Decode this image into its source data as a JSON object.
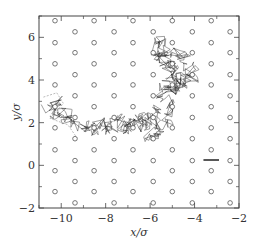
{
  "chart_data": {
    "type": "scatter",
    "title": "",
    "xlabel": "x/σ",
    "ylabel": "y/σ",
    "xlim": [
      -11,
      -2
    ],
    "ylim": [
      -2,
      7
    ],
    "xticks": [
      -10,
      -8,
      -6,
      -4,
      -2
    ],
    "yticks": [
      -2,
      0,
      2,
      4,
      6
    ],
    "xtick_labels": [
      "−10",
      "−8",
      "−6",
      "−4",
      "−2"
    ],
    "ytick_labels": [
      "−2",
      "0",
      "2",
      "4",
      "6"
    ],
    "minor_ticks": true,
    "grid": false,
    "legend": null,
    "series": [
      {
        "name": "lattice-obstacles",
        "marker": "open-circle",
        "color": "#555555",
        "columns_x": [
          -10.28,
          -9.38,
          -8.52,
          -7.62,
          -6.77,
          -5.86,
          -5.0,
          -4.1,
          -3.25,
          -2.4
        ],
        "rows_y_even": [
          6.78,
          5.75,
          4.76,
          3.77,
          2.75,
          1.76,
          0.73,
          -0.25,
          -1.23
        ],
        "rows_y_odd": [
          6.26,
          5.28,
          4.25,
          3.26,
          2.24,
          1.25,
          0.22,
          -0.76,
          -1.76
        ]
      },
      {
        "name": "particle-trajectory",
        "type": "line",
        "color": "#222222",
        "note": "dense random-walk trajectory from about (-10.5, 2.5) through (-8, 1.8) to (-4.5, 5.5)",
        "points": [
          [
            -10.6,
            2.6
          ],
          [
            -10.2,
            3.0
          ],
          [
            -10.4,
            2.3
          ],
          [
            -9.8,
            2.5
          ],
          [
            -9.6,
            2.0
          ],
          [
            -9.0,
            1.8
          ],
          [
            -8.6,
            1.6
          ],
          [
            -8.2,
            2.0
          ],
          [
            -7.8,
            1.7
          ],
          [
            -7.5,
            2.2
          ],
          [
            -7.2,
            1.6
          ],
          [
            -6.9,
            2.1
          ],
          [
            -6.6,
            1.8
          ],
          [
            -6.3,
            2.4
          ],
          [
            -6.0,
            1.9
          ],
          [
            -5.7,
            2.6
          ],
          [
            -6.1,
            1.2
          ],
          [
            -5.6,
            1.5
          ],
          [
            -5.3,
            2.0
          ],
          [
            -5.1,
            2.8
          ],
          [
            -5.5,
            3.3
          ],
          [
            -5.2,
            3.8
          ],
          [
            -4.9,
            3.5
          ],
          [
            -4.6,
            4.0
          ],
          [
            -4.9,
            4.5
          ],
          [
            -5.3,
            4.8
          ],
          [
            -5.6,
            5.2
          ],
          [
            -5.0,
            5.4
          ],
          [
            -4.5,
            5.1
          ],
          [
            -4.2,
            4.6
          ],
          [
            -4.0,
            4.2
          ],
          [
            -4.6,
            3.9
          ],
          [
            -5.1,
            4.3
          ],
          [
            -5.8,
            5.6
          ],
          [
            -5.4,
            5.9
          ]
        ]
      }
    ],
    "annotations": [
      {
        "type": "scale-bar",
        "x": [
          -3.6,
          -2.9
        ],
        "y": 0.25,
        "color": "#111111"
      }
    ]
  }
}
